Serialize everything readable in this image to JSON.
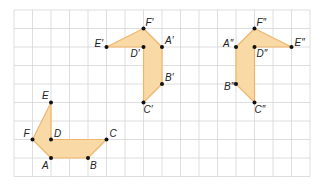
{
  "grid": {
    "origin_x": 14,
    "origin_y": 10,
    "cell": 18.5,
    "cols": 16,
    "rows": 9,
    "line_color": "#d6d6d6"
  },
  "style": {
    "fill": "#f9d9a6",
    "stroke": "#efb56d",
    "point_color": "#111111"
  },
  "figures": [
    {
      "name": "original",
      "outline": [
        "F",
        "E",
        "D",
        "C",
        "B",
        "A"
      ],
      "points": [
        {
          "label": "A",
          "x": 2,
          "y": 8,
          "dx": -9,
          "dy": 11
        },
        {
          "label": "B",
          "x": 4,
          "y": 8,
          "dx": 2,
          "dy": 11
        },
        {
          "label": "C",
          "x": 5,
          "y": 7,
          "dx": 3,
          "dy": -3
        },
        {
          "label": "D",
          "x": 2,
          "y": 7,
          "dx": 3,
          "dy": -3
        },
        {
          "label": "E",
          "x": 2,
          "y": 5,
          "dx": -9,
          "dy": -4
        },
        {
          "label": "F",
          "x": 1,
          "y": 7,
          "dx": -9,
          "dy": -3
        }
      ]
    },
    {
      "name": "image-prime",
      "outline": [
        "E′",
        "F′",
        "A′",
        "B′",
        "C′",
        "D′"
      ],
      "points": [
        {
          "label": "A′",
          "x": 8,
          "y": 2,
          "dx": 3,
          "dy": -3
        },
        {
          "label": "B′",
          "x": 8,
          "y": 4,
          "dx": 3,
          "dy": -3
        },
        {
          "label": "C′",
          "x": 7,
          "y": 5,
          "dx": 0,
          "dy": 10
        },
        {
          "label": "D′",
          "x": 7,
          "y": 2,
          "dx": -13,
          "dy": 10
        },
        {
          "label": "E′",
          "x": 5,
          "y": 2,
          "dx": -12,
          "dy": 0
        },
        {
          "label": "F′",
          "x": 7,
          "y": 1,
          "dx": 2,
          "dy": -3
        }
      ]
    },
    {
      "name": "image-double-prime",
      "outline": [
        "E″",
        "F″",
        "A″",
        "B″",
        "C″",
        "D″"
      ],
      "points": [
        {
          "label": "A″",
          "x": 12,
          "y": 2,
          "dx": -13,
          "dy": 0
        },
        {
          "label": "B″",
          "x": 12,
          "y": 4,
          "dx": -12,
          "dy": 6
        },
        {
          "label": "C″",
          "x": 13,
          "y": 5,
          "dx": 0,
          "dy": 10
        },
        {
          "label": "D″",
          "x": 13,
          "y": 2,
          "dx": 2,
          "dy": 10
        },
        {
          "label": "E″",
          "x": 15,
          "y": 2,
          "dx": 3,
          "dy": -1
        },
        {
          "label": "F″",
          "x": 13,
          "y": 1,
          "dx": 2,
          "dy": -3
        }
      ]
    }
  ]
}
